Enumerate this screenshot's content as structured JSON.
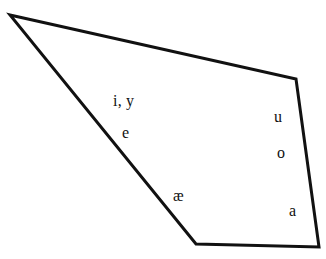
{
  "figure": {
    "name": "vowel-quadrilateral",
    "background_color": "#ffffff",
    "stroke_color": "#111111",
    "text_color": "#111111",
    "stroke_width": 3,
    "width": 326,
    "height": 259
  },
  "chart_data": {
    "type": "scatter",
    "title": "",
    "xlabel": "",
    "ylabel": "",
    "grid": false,
    "legend": null,
    "shape": {
      "name": "vowel-quadrilateral-outline",
      "closed": true,
      "vertices": [
        {
          "name": "top-left-apex",
          "x": 10,
          "y": 15
        },
        {
          "name": "top-right",
          "x": 296,
          "y": 79
        },
        {
          "name": "bottom-right",
          "x": 319,
          "y": 247
        },
        {
          "name": "bottom-left",
          "x": 196,
          "y": 244
        }
      ]
    },
    "points": [
      {
        "label": "i, y",
        "x": 113,
        "y": 95
      },
      {
        "label": "e",
        "x": 122,
        "y": 127
      },
      {
        "label": "u",
        "x": 274,
        "y": 111
      },
      {
        "label": "o",
        "x": 277,
        "y": 147
      },
      {
        "label": "æ",
        "x": 173,
        "y": 190
      },
      {
        "label": "a",
        "x": 289,
        "y": 205
      }
    ]
  },
  "labels": {
    "front_close": "i, y",
    "front_mid": "e",
    "back_close": "u",
    "back_mid": "o",
    "front_open": "æ",
    "back_open": "a"
  }
}
